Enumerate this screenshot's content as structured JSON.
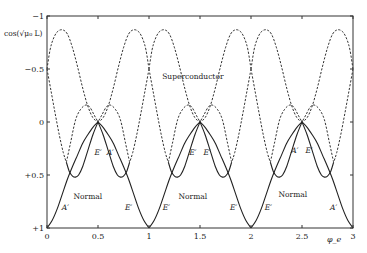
{
  "chart_data": {
    "type": "line",
    "title": "",
    "xlabel": "φ_e",
    "ylabel": "cos(√μ₀ L)",
    "xlim": [
      0,
      3
    ],
    "ylim": [
      -1,
      1
    ],
    "y_inverted": true,
    "grid": false,
    "x_ticks": [
      0,
      0.5,
      1,
      1.5,
      2,
      2.5,
      3
    ],
    "x_tick_labels": [
      "0",
      "0.5",
      "1",
      "1.5",
      "2",
      "2.5",
      "3"
    ],
    "y_ticks": [
      -1,
      -0.5,
      0,
      0.5,
      1
    ],
    "y_tick_labels": [
      "−1",
      "−0.5",
      "0",
      "+0.5",
      "+1"
    ],
    "period": 1,
    "series": [
      {
        "name": "Normal outer band (solid)",
        "style": "solid",
        "x": [
          0,
          0.05,
          0.1,
          0.15,
          0.2,
          0.25,
          0.3,
          0.35,
          0.4,
          0.45,
          0.5
        ],
        "y": [
          1,
          0.93,
          0.82,
          0.68,
          0.54,
          0.42,
          0.31,
          0.2,
          0.12,
          0.05,
          0
        ]
      },
      {
        "name": "Normal inner band (solid)",
        "style": "solid",
        "x": [
          0.19,
          0.22,
          0.25,
          0.28,
          0.31,
          0.35,
          0.4,
          0.45,
          0.5
        ],
        "y": [
          0.38,
          0.47,
          0.51,
          0.52,
          0.5,
          0.42,
          0.27,
          0.12,
          0
        ]
      },
      {
        "name": "Superconductor band A (dashed)",
        "style": "dashed",
        "x": [
          0,
          0.03,
          0.06,
          0.1,
          0.15,
          0.2,
          0.25,
          0.3,
          0.35,
          0.4,
          0.45,
          0.5
        ],
        "y": [
          -0.5,
          -0.68,
          -0.78,
          -0.85,
          -0.87,
          -0.83,
          -0.7,
          -0.52,
          -0.32,
          -0.15,
          -0.04,
          0
        ]
      },
      {
        "name": "Superconductor band B (dashed)",
        "style": "dashed",
        "x": [
          0,
          0.04,
          0.08,
          0.12,
          0.16,
          0.19
        ],
        "y": [
          -0.5,
          -0.29,
          -0.08,
          0.12,
          0.29,
          0.38
        ]
      },
      {
        "name": "Superconductor band C (dashed)",
        "style": "dashed",
        "x": [
          0.19,
          0.23,
          0.28,
          0.33,
          0.38,
          0.42,
          0.46,
          0.5
        ],
        "y": [
          0.38,
          0.2,
          -0.02,
          -0.12,
          -0.16,
          -0.14,
          -0.07,
          0
        ]
      }
    ],
    "symmetry_note": "Each series repeats with period 1 and is mirrored about φ = k + 0.5",
    "annotations": [
      {
        "text": "Superconductor",
        "x": 1.43,
        "y": -0.43,
        "style": "roman"
      },
      {
        "text": "Normal",
        "x": 0.4,
        "y": 0.7,
        "style": "roman"
      },
      {
        "text": "Normal",
        "x": 1.43,
        "y": 0.7,
        "style": "roman"
      },
      {
        "text": "Normal",
        "x": 2.41,
        "y": 0.68,
        "style": "roman"
      },
      {
        "text": "A′",
        "x": 0.18,
        "y": 0.8,
        "style": "italic"
      },
      {
        "text": "E′",
        "x": 0.5,
        "y": 0.28,
        "style": "italic"
      },
      {
        "text": "A′",
        "x": 0.62,
        "y": 0.28,
        "style": "italic"
      },
      {
        "text": "E′",
        "x": 0.8,
        "y": 0.8,
        "style": "italic"
      },
      {
        "text": "E′",
        "x": 1.17,
        "y": 0.8,
        "style": "italic"
      },
      {
        "text": "E′",
        "x": 1.43,
        "y": 0.28,
        "style": "italic"
      },
      {
        "text": "E′",
        "x": 1.57,
        "y": 0.28,
        "style": "italic"
      },
      {
        "text": "E′",
        "x": 1.83,
        "y": 0.8,
        "style": "italic"
      },
      {
        "text": "E′",
        "x": 2.17,
        "y": 0.8,
        "style": "italic"
      },
      {
        "text": "A′",
        "x": 2.43,
        "y": 0.26,
        "style": "italic"
      },
      {
        "text": "E′",
        "x": 2.57,
        "y": 0.26,
        "style": "italic"
      },
      {
        "text": "A′",
        "x": 2.81,
        "y": 0.8,
        "style": "italic"
      }
    ]
  }
}
